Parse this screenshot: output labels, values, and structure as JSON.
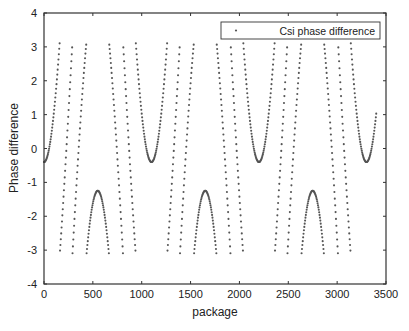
{
  "chart_data": {
    "type": "scatter",
    "title": "",
    "xlabel": "package",
    "ylabel": "Phase difference",
    "xlim": [
      0,
      3500
    ],
    "ylim": [
      -4,
      4
    ],
    "xticks": [
      0,
      500,
      1000,
      1500,
      2000,
      2500,
      3000,
      3500
    ],
    "yticks": [
      -4,
      -3,
      -2,
      -1,
      0,
      1,
      2,
      3,
      4
    ],
    "grid": false,
    "legend": {
      "position": "upper right",
      "entries": [
        "Csi phase difference"
      ]
    },
    "series": [
      {
        "name": "Csi phase difference",
        "marker": "dot",
        "color": "#555555",
        "description": "Phase wrapped to [-pi, pi]; periodic pattern with period ~1100 packages",
        "model": {
          "offset": -0.4,
          "amplitude": 9.0,
          "period": 1100,
          "x_start": 0,
          "x_end": 3400,
          "step": 4
        },
        "key_points": [
          {
            "x": 0,
            "y": -0.4,
            "note": "valley"
          },
          {
            "x": 550,
            "y": -1.25,
            "note": "peak"
          },
          {
            "x": 1100,
            "y": -0.4,
            "note": "valley"
          },
          {
            "x": 1650,
            "y": -1.25,
            "note": "peak"
          },
          {
            "x": 2200,
            "y": -0.4,
            "note": "valley"
          },
          {
            "x": 2750,
            "y": -1.25,
            "note": "peak"
          },
          {
            "x": 3300,
            "y": -0.4,
            "note": "valley"
          }
        ]
      }
    ]
  }
}
